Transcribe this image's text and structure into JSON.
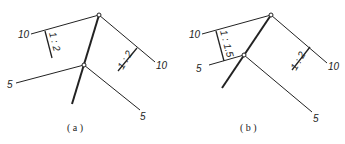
{
  "figures": [
    {
      "caption": "( a )",
      "contours": {
        "upper_left": "10",
        "upper_right": "10",
        "lower_left": "5",
        "lower_right": "5"
      },
      "slopes": {
        "left": "1 : 2",
        "right": "1 : 2"
      }
    },
    {
      "caption": "( b )",
      "contours": {
        "upper_left": "10",
        "upper_right": "10",
        "lower_left": "5",
        "lower_right": "5"
      },
      "slopes": {
        "left": "1 : 1.5",
        "right": "1 : 2"
      }
    }
  ],
  "colors": {
    "line": "#222222",
    "background": "#ffffff"
  }
}
